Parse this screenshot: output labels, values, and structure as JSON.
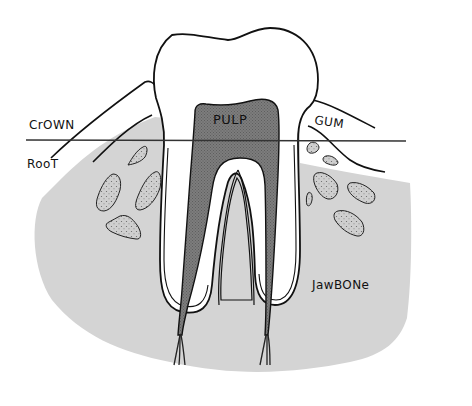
{
  "diagram": {
    "labels": {
      "crown": "CrOWN",
      "root": "RooT",
      "pulp": "PULP",
      "gum": "GUM",
      "jawbone": "JawBONe"
    },
    "colors": {
      "background": "#ffffff",
      "jawbone": "#d4d4d4",
      "pulp": "#7a7a7a",
      "tooth": "#ffffff",
      "bone_fragment": "#c8c8c8",
      "outline": "#111111",
      "divider_line": "#333333"
    },
    "parts": [
      "crown",
      "root",
      "pulp",
      "gum",
      "jawbone",
      "root-canals",
      "nerve-endings",
      "bone-fragments",
      "crown-root-divider"
    ]
  }
}
